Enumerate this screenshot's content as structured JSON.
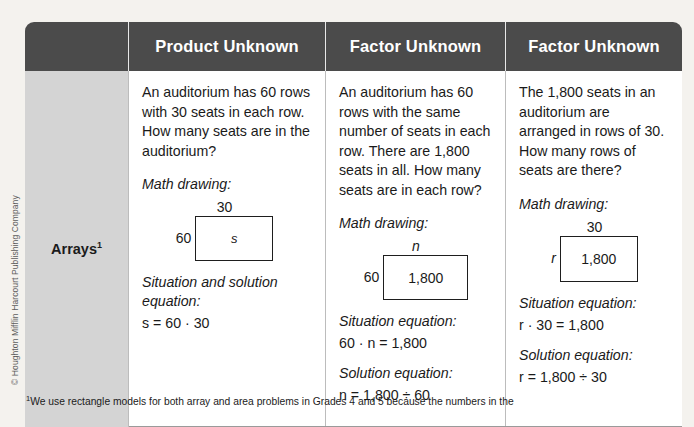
{
  "copyright": "© Houghton Mifflin Harcourt Publishing Company",
  "colors": {
    "page_background": "#f4f2ee",
    "header_background": "#4b4b4b",
    "header_text": "#ffffff",
    "label_cell_background": "#d4d4d4",
    "cell_background": "#ffffff",
    "rule": "#bcbcbc"
  },
  "table": {
    "header": {
      "corner_label": "",
      "columns": [
        "Product Unknown",
        "Factor Unknown",
        "Factor Unknown"
      ]
    },
    "row_label": "Arrays",
    "row_label_superscript": "1",
    "cells": [
      {
        "problem": "An auditorium has 60 rows with 30 seats in each row. How many seats are in the auditorium?",
        "drawing_heading": "Math drawing:",
        "drawing": {
          "top_label": "30",
          "side_label": "60",
          "inside_label": "s",
          "inside_italic": true,
          "top_italic": false,
          "side_italic": false
        },
        "equations": [
          {
            "heading": "Situation and solution equation:",
            "equation": "s = 60 · 30"
          }
        ]
      },
      {
        "problem": "An auditorium has 60 rows with the same number of seats in each row. There are 1,800 seats in all. How many seats are in each row?",
        "drawing_heading": "Math drawing:",
        "drawing": {
          "top_label": "n",
          "side_label": "60",
          "inside_label": "1,800",
          "inside_italic": false,
          "top_italic": true,
          "side_italic": false
        },
        "equations": [
          {
            "heading": "Situation equation:",
            "equation": "60 · n = 1,800"
          },
          {
            "heading": "Solution equation:",
            "equation": "n = 1,800 ÷ 60"
          }
        ]
      },
      {
        "problem": "The 1,800 seats in an auditorium are arranged in rows of 30. How many rows of seats are there?",
        "drawing_heading": "Math drawing:",
        "drawing": {
          "top_label": "30",
          "side_label": "r",
          "inside_label": "1,800",
          "inside_italic": false,
          "top_italic": false,
          "side_italic": true
        },
        "equations": [
          {
            "heading": "Situation equation:",
            "equation": "r · 30 = 1,800"
          },
          {
            "heading": "Solution equation:",
            "equation": "r = 1,800 ÷ 30"
          }
        ]
      }
    ]
  },
  "footnote": {
    "marker": "1",
    "text": "We use rectangle models for both array and area problems in Grades 4 and 5 because the numbers in the"
  }
}
